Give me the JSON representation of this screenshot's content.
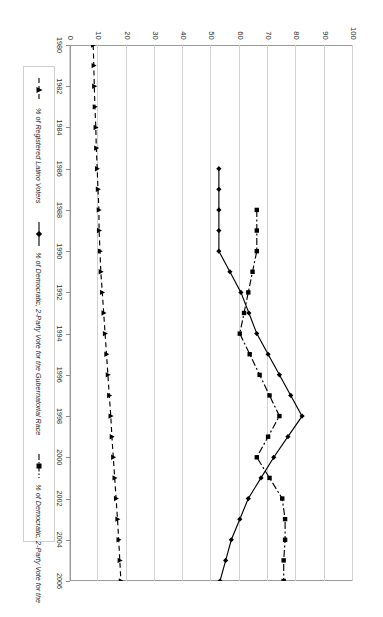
{
  "chart_data": {
    "type": "line",
    "title": "",
    "xlabel": "",
    "ylabel": "",
    "ylim": [
      0,
      100
    ],
    "y_ticks": [
      0,
      10,
      20,
      30,
      40,
      50,
      60,
      70,
      80,
      90,
      100
    ],
    "grid": true,
    "legend_position": "bottom",
    "orientation": "rotated-90-ccw",
    "x": [
      1980,
      1981,
      1982,
      1983,
      1984,
      1985,
      1986,
      1987,
      1988,
      1989,
      1990,
      1991,
      1992,
      1993,
      1994,
      1995,
      1996,
      1997,
      1998,
      1999,
      2000,
      2001,
      2002,
      2003,
      2004,
      2005,
      2006
    ],
    "x_tick_labels": [
      "1980",
      "1982",
      "1984",
      "1986",
      "1988",
      "1990",
      "1992",
      "1994",
      "1996",
      "1998",
      "2000",
      "2002",
      "2004",
      "2006"
    ],
    "series": [
      {
        "name": "% of Registered Latino Voters",
        "marker": "triangle",
        "line_style": "dashed",
        "color": "#000000",
        "values": [
          8.2,
          8.4,
          8.6,
          8.8,
          9.1,
          9.3,
          9.6,
          9.9,
          10.2,
          10.3,
          10.6,
          10.9,
          11.4,
          11.9,
          12.4,
          12.9,
          13.4,
          13.9,
          14.4,
          14.8,
          15.3,
          15.8,
          16.3,
          16.8,
          17.2,
          17.6,
          18.0
        ]
      },
      {
        "name": "% of Democratic, 2-Party Vote for the Gubernatorial Race",
        "marker": "diamond",
        "line_style": "solid",
        "color": "#000000",
        "values": [
          null,
          null,
          null,
          null,
          null,
          null,
          52.6,
          52.6,
          52.6,
          52.6,
          52.6,
          56.5,
          60.4,
          63.2,
          66.0,
          70.0,
          74.0,
          78.0,
          82.0,
          77.0,
          72.0,
          67.5,
          63.0,
          60.0,
          57.0,
          55.0,
          53.0
        ]
      },
      {
        "name": "% of Democratic, 2-Party Vote for the Senatorial Race",
        "marker": "square",
        "line_style": "dash-dot",
        "color": "#000000",
        "values": [
          null,
          null,
          null,
          null,
          null,
          null,
          null,
          null,
          66.0,
          66.0,
          66.0,
          64.5,
          63.0,
          61.5,
          60.0,
          63.5,
          67.0,
          70.5,
          74.0,
          70.0,
          66.0,
          70.5,
          75.0,
          76.0,
          76.0,
          75.5,
          75.5
        ]
      }
    ]
  },
  "legend": {
    "entries": [
      {
        "label": "% of Registered Latino Voters",
        "key": "triangle-dashed-key"
      },
      {
        "label": "% of Democratic, 2-Party Vote for the Gubernatorial Race",
        "key": "diamond-solid-key"
      },
      {
        "label": "% of Democratic, 2-Party Vote for the Senatorial Race",
        "key": "square-dashdot-key"
      }
    ]
  }
}
